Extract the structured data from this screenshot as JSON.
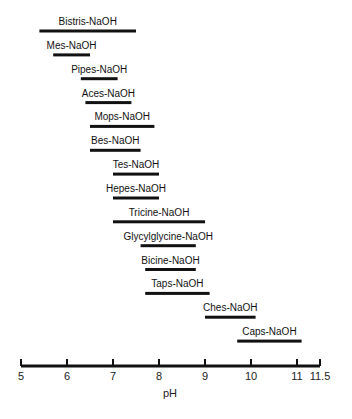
{
  "chart_data": {
    "type": "bar",
    "orientation": "horizontal-range",
    "title": "",
    "xlabel": "pH",
    "ylabel": "",
    "xlim": [
      5,
      11.5
    ],
    "x_ticks": [
      5,
      6,
      7,
      8,
      9,
      10,
      11,
      11.5
    ],
    "x_tick_labels": [
      "5",
      "6",
      "7",
      "8",
      "9",
      "10",
      "11",
      "11.5"
    ],
    "grid": false,
    "legend": null,
    "series": [
      {
        "name": "Bistris-NaOH",
        "start": 5.4,
        "end": 7.5
      },
      {
        "name": "Mes-NaOH",
        "start": 5.7,
        "end": 6.5
      },
      {
        "name": "Pipes-NaOH",
        "start": 6.3,
        "end": 7.1
      },
      {
        "name": "Aces-NaOH",
        "start": 6.4,
        "end": 7.4
      },
      {
        "name": "Mops-NaOH",
        "start": 6.5,
        "end": 7.9
      },
      {
        "name": "Bes-NaOH",
        "start": 6.5,
        "end": 7.6
      },
      {
        "name": "Tes-NaOH",
        "start": 7.0,
        "end": 8.0
      },
      {
        "name": "Hepes-NaOH",
        "start": 7.0,
        "end": 8.0
      },
      {
        "name": "Tricine-NaOH",
        "start": 7.0,
        "end": 9.0
      },
      {
        "name": "Glycylglycine-NaOH",
        "start": 7.6,
        "end": 8.8
      },
      {
        "name": "Bicine-NaOH",
        "start": 7.7,
        "end": 8.8
      },
      {
        "name": "Taps-NaOH",
        "start": 7.7,
        "end": 9.1
      },
      {
        "name": "Ches-NaOH",
        "start": 9.0,
        "end": 10.1
      },
      {
        "name": "Caps-NaOH",
        "start": 9.7,
        "end": 11.1
      }
    ]
  },
  "colors": {
    "bar": "#111111",
    "axis": "#111111",
    "text": "#222222",
    "background": "#ffffff"
  }
}
